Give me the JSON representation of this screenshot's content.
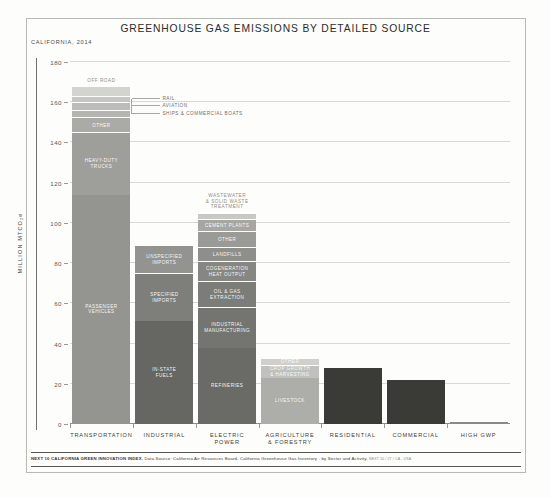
{
  "header": {
    "title": "GREENHOUSE GAS EMISSIONS BY DETAILED SOURCE",
    "subtitle": "CALIFORNIA, 2014"
  },
  "footer": {
    "source_bold": "NEXT 10 CALIFORNIA GREEN INNOVATION INDEX.",
    "source_text": "Data Source: California Air Resources Board, California Greenhouse Gas Inventory - by Sector and Activity,",
    "source_note": "NEXT 10 / 27 / CA - USA"
  },
  "chart_data": {
    "type": "bar",
    "title": "GREENHOUSE GAS EMISSIONS BY DETAILED SOURCE",
    "subtitle": "CALIFORNIA, 2014",
    "xlabel": "",
    "ylabel": "MILLION MTCO₂e",
    "ylim": [
      0,
      180
    ],
    "yticks": [
      0,
      20,
      40,
      60,
      80,
      100,
      120,
      140,
      160,
      180
    ],
    "grid": true,
    "legend": "none",
    "stacked": true,
    "categories": [
      "TRANSPORTATION",
      "INDUSTRIAL",
      "ELECTRIC\nPOWER",
      "AGRICULTURE\n& FORESTRY",
      "RESIDENTIAL",
      "COMMERCIAL",
      "HIGH GWP"
    ],
    "totals": [
      168,
      89,
      105,
      33,
      28,
      22,
      1
    ],
    "bars": [
      {
        "category": "TRANSPORTATION",
        "total": 168,
        "color": "#9b9b97",
        "segments": [
          {
            "label": "OFF ROAD",
            "value": 5.0,
            "color": "#d3d3cf",
            "label_position": "above"
          },
          {
            "label": "RAIL",
            "value": 3.0,
            "color": "#c6c6c2",
            "label_position": "callout-right"
          },
          {
            "label": "AVIATION",
            "value": 4.0,
            "color": "#bcbcb8",
            "label_position": "callout-right"
          },
          {
            "label": "SHIPS & COMMERCIAL BOATS",
            "value": 3.5,
            "color": "#b4b4b0",
            "label_position": "callout-right"
          },
          {
            "label": "OTHER",
            "value": 7.5,
            "color": "#aaaaa6",
            "label_position": "inside"
          },
          {
            "label": "HEAVY-DUTY\nTRUCKS",
            "value": 31.0,
            "color": "#9e9e9a",
            "label_position": "inside"
          },
          {
            "label": "PASSENGER\nVEHICLES",
            "value": 114.0,
            "color": "#949490",
            "label_position": "inside"
          }
        ]
      },
      {
        "category": "INDUSTRIAL",
        "total": 89,
        "color": "#6e6e6a",
        "segments": [
          {
            "label": "UNSPECIFIED\nIMPORTS",
            "value": 14.0,
            "color": "#93938f",
            "label_position": "inside"
          },
          {
            "label": "SPECIFIED\nIMPORTS",
            "value": 24.0,
            "color": "#7e7e7a",
            "label_position": "inside"
          },
          {
            "label": "IN-STATE\nFUELS",
            "value": 51.0,
            "color": "#666662",
            "label_position": "inside"
          }
        ]
      },
      {
        "category": "ELECTRIC POWER",
        "total": 105,
        "color": "#8a8a86",
        "segments": [
          {
            "label": "WASTEWATER\n& SOLID WASTE\nTREATMENT",
            "value": 3.0,
            "color": "#c8c8c4",
            "label_position": "above"
          },
          {
            "label": "CEMENT PLANTS",
            "value": 6.0,
            "color": "#a6a6a2",
            "label_position": "inside"
          },
          {
            "label": "OTHER",
            "value": 8.0,
            "color": "#9a9a96",
            "label_position": "inside"
          },
          {
            "label": "LANDFILLS",
            "value": 7.0,
            "color": "#8e8e8a",
            "label_position": "inside"
          },
          {
            "label": "COGENERATION\nHEAT OUTPUT",
            "value": 10.0,
            "color": "#868682",
            "label_position": "inside"
          },
          {
            "label": "OIL & GAS\nEXTRACTION",
            "value": 13.0,
            "color": "#7c7c78",
            "label_position": "inside"
          },
          {
            "label": "INDUSTRIAL\nMANUFACTURING",
            "value": 20.0,
            "color": "#747470",
            "label_position": "inside"
          },
          {
            "label": "REFINERIES",
            "value": 38.0,
            "color": "#6a6a66",
            "label_position": "inside"
          }
        ]
      },
      {
        "category": "AGRICULTURE & FORESTRY",
        "total": 33,
        "color": "#a8a8a4",
        "segments": [
          {
            "label": "OTHER",
            "value": 3.5,
            "color": "#cfcfcb",
            "label_position": "inside"
          },
          {
            "label": "CROP GROWTH\n& HARVESTING",
            "value": 6.5,
            "color": "#c0c0bc",
            "label_position": "inside"
          },
          {
            "label": "LIVESTOCK",
            "value": 23.0,
            "color": "#adadA9",
            "label_position": "inside"
          }
        ]
      },
      {
        "category": "RESIDENTIAL",
        "total": 28,
        "color": "#3a3a36",
        "segments": [
          {
            "label": "",
            "value": 28.0,
            "color": "#3a3a36",
            "label_position": "none"
          }
        ]
      },
      {
        "category": "COMMERCIAL",
        "total": 22,
        "color": "#3a3a36",
        "segments": [
          {
            "label": "",
            "value": 22.0,
            "color": "#3a3a36",
            "label_position": "none"
          }
        ]
      },
      {
        "category": "HIGH GWP",
        "total": 1,
        "color": "#8a8a86",
        "segments": [
          {
            "label": "",
            "value": 1.0,
            "color": "#8a8a86",
            "label_position": "none"
          }
        ]
      }
    ],
    "callouts": [
      {
        "label": "OFF ROAD",
        "target_bar": "TRANSPORTATION"
      },
      {
        "label": "RAIL",
        "target_bar": "TRANSPORTATION"
      },
      {
        "label": "AVIATION",
        "target_bar": "TRANSPORTATION"
      },
      {
        "label": "SHIPS & COMMERCIAL BOATS",
        "target_bar": "TRANSPORTATION"
      },
      {
        "label": "WASTEWATER\n& SOLID WASTE\nTREATMENT",
        "target_bar": "ELECTRIC POWER"
      }
    ]
  }
}
